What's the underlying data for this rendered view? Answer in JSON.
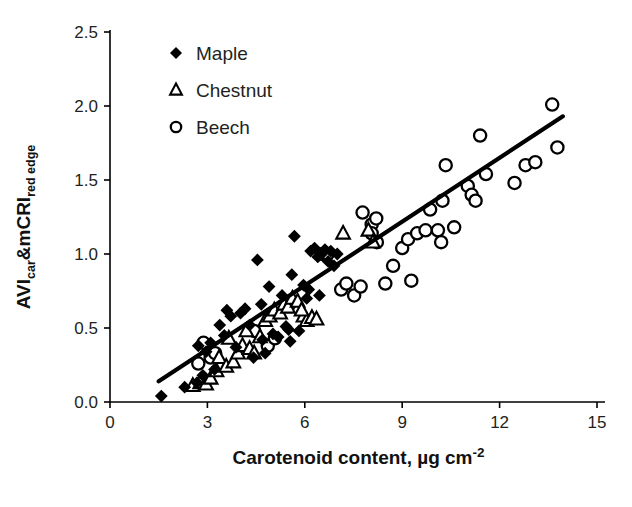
{
  "chart_data": {
    "type": "scatter",
    "title": "",
    "xlabel": "Carotenoid content, µg cm⁻²",
    "xlabel_main": "Carotenoid content, µg cm",
    "xlabel_sup": "-2",
    "ylabel": "AVIcar&mCRIred edge",
    "ylabel_parts": [
      "AVI",
      "car",
      "&mCRI",
      "red edge"
    ],
    "xlim": [
      0,
      15
    ],
    "ylim": [
      0.0,
      2.5
    ],
    "xticks": [
      "0",
      "3",
      "6",
      "9",
      "12",
      "15"
    ],
    "xtick_values": [
      0,
      3,
      6,
      9,
      12,
      15
    ],
    "yticks": [
      "0.0",
      "0.5",
      "1.0",
      "1.5",
      "2.0",
      "2.5"
    ],
    "ytick_values": [
      0.0,
      0.5,
      1.0,
      1.5,
      2.0,
      2.5
    ],
    "grid": false,
    "legend_position": "top-left-inside",
    "marker_color": "#000000",
    "trendline": {
      "x0": 1.5,
      "y0": 0.14,
      "x1": 13.95,
      "y1": 1.93,
      "color": "#000000"
    },
    "series": [
      {
        "name": "Maple",
        "marker": "filled-diamond",
        "points": [
          [
            1.58,
            0.04
          ],
          [
            2.3,
            0.1
          ],
          [
            2.68,
            0.13
          ],
          [
            2.86,
            0.18
          ],
          [
            2.72,
            0.38
          ],
          [
            2.96,
            0.34
          ],
          [
            3.1,
            0.4
          ],
          [
            3.22,
            0.22
          ],
          [
            3.38,
            0.52
          ],
          [
            3.52,
            0.45
          ],
          [
            3.6,
            0.62
          ],
          [
            3.72,
            0.58
          ],
          [
            3.88,
            0.37
          ],
          [
            4.02,
            0.6
          ],
          [
            4.16,
            0.63
          ],
          [
            4.3,
            0.52
          ],
          [
            4.42,
            0.3
          ],
          [
            4.54,
            0.96
          ],
          [
            4.66,
            0.66
          ],
          [
            4.78,
            0.33
          ],
          [
            4.9,
            0.78
          ],
          [
            5.02,
            0.46
          ],
          [
            5.18,
            0.44
          ],
          [
            5.3,
            0.72
          ],
          [
            5.42,
            0.51
          ],
          [
            5.5,
            0.49
          ],
          [
            5.6,
            0.86
          ],
          [
            5.68,
            1.12
          ],
          [
            5.82,
            0.48
          ],
          [
            5.96,
            0.79
          ],
          [
            6.06,
            0.7
          ],
          [
            6.18,
            1.02
          ],
          [
            6.3,
            1.04
          ],
          [
            6.4,
            0.98
          ],
          [
            6.52,
            1.0
          ],
          [
            6.62,
            1.03
          ],
          [
            6.72,
            0.95
          ],
          [
            6.8,
            1.02
          ],
          [
            6.9,
            0.92
          ],
          [
            7.0,
            1.0
          ],
          [
            5.55,
            0.41
          ],
          [
            4.7,
            0.42
          ],
          [
            6.45,
            0.72
          ],
          [
            6.12,
            0.76
          ]
        ]
      },
      {
        "name": "Chestnut",
        "marker": "open-triangle",
        "points": [
          [
            2.55,
            0.11
          ],
          [
            2.78,
            0.13
          ],
          [
            2.96,
            0.12
          ],
          [
            3.1,
            0.16
          ],
          [
            3.28,
            0.21
          ],
          [
            3.36,
            0.3
          ],
          [
            3.58,
            0.24
          ],
          [
            3.8,
            0.27
          ],
          [
            3.94,
            0.33
          ],
          [
            4.08,
            0.38
          ],
          [
            4.3,
            0.36
          ],
          [
            4.44,
            0.33
          ],
          [
            4.62,
            0.44
          ],
          [
            4.78,
            0.55
          ],
          [
            4.92,
            0.58
          ],
          [
            5.06,
            0.62
          ],
          [
            5.24,
            0.6
          ],
          [
            5.36,
            0.66
          ],
          [
            5.48,
            0.64
          ],
          [
            5.62,
            0.7
          ],
          [
            5.78,
            0.68
          ],
          [
            5.96,
            0.58
          ],
          [
            6.06,
            0.55
          ],
          [
            6.22,
            0.57
          ],
          [
            6.36,
            0.56
          ],
          [
            7.18,
            1.14
          ],
          [
            7.96,
            1.16
          ],
          [
            8.1,
            1.08
          ],
          [
            3.66,
            0.43
          ],
          [
            4.2,
            0.48
          ],
          [
            5.9,
            0.62
          ]
        ]
      },
      {
        "name": "Beech",
        "marker": "open-circle",
        "points": [
          [
            2.72,
            0.26
          ],
          [
            2.88,
            0.4
          ],
          [
            3.1,
            0.3
          ],
          [
            3.24,
            0.33
          ],
          [
            4.44,
            0.48
          ],
          [
            4.86,
            0.38
          ],
          [
            5.08,
            0.43
          ],
          [
            5.52,
            0.66
          ],
          [
            6.56,
            1.0
          ],
          [
            6.7,
            1.0
          ],
          [
            7.12,
            0.76
          ],
          [
            7.52,
            0.72
          ],
          [
            7.72,
            0.78
          ],
          [
            7.78,
            1.28
          ],
          [
            8.06,
            1.2
          ],
          [
            8.06,
            1.14
          ],
          [
            8.22,
            1.08
          ],
          [
            8.48,
            0.8
          ],
          [
            8.72,
            0.92
          ],
          [
            9.0,
            1.04
          ],
          [
            9.18,
            1.1
          ],
          [
            9.28,
            0.82
          ],
          [
            9.46,
            1.14
          ],
          [
            9.72,
            1.16
          ],
          [
            9.86,
            1.3
          ],
          [
            10.1,
            1.16
          ],
          [
            10.2,
            1.08
          ],
          [
            10.24,
            1.36
          ],
          [
            10.34,
            1.6
          ],
          [
            11.02,
            1.46
          ],
          [
            11.14,
            1.4
          ],
          [
            11.26,
            1.36
          ],
          [
            11.4,
            1.8
          ],
          [
            11.58,
            1.54
          ],
          [
            12.46,
            1.48
          ],
          [
            12.8,
            1.6
          ],
          [
            13.1,
            1.62
          ],
          [
            13.62,
            2.01
          ],
          [
            13.78,
            1.72
          ],
          [
            8.2,
            1.24
          ],
          [
            7.28,
            0.8
          ],
          [
            10.6,
            1.18
          ]
        ]
      }
    ]
  },
  "legend": {
    "items": [
      {
        "label": "Maple",
        "marker": "filled-diamond"
      },
      {
        "label": "Chestnut",
        "marker": "open-triangle"
      },
      {
        "label": "Beech",
        "marker": "open-circle"
      }
    ]
  }
}
